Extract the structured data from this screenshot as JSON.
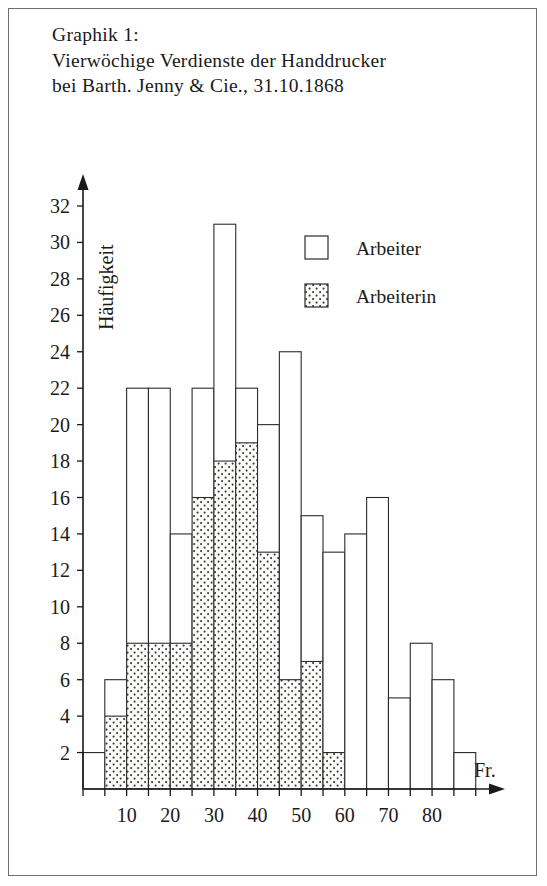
{
  "figure": {
    "title_lines": [
      "Graphik 1:",
      "Vierwöchige Verdienste der Handdrucker",
      "bei Barth. Jenny & Cie., 31.10.1868"
    ]
  },
  "axes": {
    "y_title": "Häufigkeit",
    "x_title": "Fr.",
    "y_ticklabels": [
      "2",
      "4",
      "6",
      "8",
      "10",
      "12",
      "14",
      "16",
      "18",
      "20",
      "22",
      "24",
      "26",
      "28",
      "30",
      "32"
    ],
    "x_ticklabels": [
      "10",
      "20",
      "30",
      "40",
      "50",
      "60",
      "70",
      "80"
    ]
  },
  "legend": {
    "position": "upper-right",
    "items": [
      {
        "label": "Arbeiter",
        "swatch": "white-box"
      },
      {
        "label": "Arbeiterin",
        "swatch": "dotted-box"
      }
    ]
  },
  "chart_data": {
    "type": "bar",
    "title": "Graphik 1: Vierwöchige Verdienste der Handdrucker bei Barth. Jenny & Cie., 31.10.1868",
    "xlabel": "Fr.",
    "ylabel": "Häufigkeit",
    "xlim": [
      0,
      92
    ],
    "ylim": [
      0,
      33
    ],
    "bin_width": 5,
    "grid": false,
    "stacked": true,
    "bin_starts": [
      0,
      5,
      10,
      15,
      20,
      25,
      30,
      35,
      40,
      45,
      50,
      55,
      60,
      65,
      70,
      75,
      80,
      85
    ],
    "bin_labels": [
      "0-5",
      "5-10",
      "10-15",
      "15-20",
      "20-25",
      "25-30",
      "30-35",
      "35-40",
      "40-45",
      "45-50",
      "50-55",
      "55-60",
      "60-65",
      "65-70",
      "70-75",
      "75-80",
      "80-85",
      "85-90"
    ],
    "series": [
      {
        "name": "Arbeiterin",
        "values": [
          0,
          4,
          8,
          8,
          8,
          16,
          18,
          19,
          13,
          6,
          7,
          2,
          0,
          0,
          0,
          0,
          0,
          0
        ]
      },
      {
        "name": "Arbeiter",
        "values": [
          2,
          2,
          14,
          14,
          6,
          6,
          13,
          3,
          7,
          18,
          8,
          11,
          14,
          16,
          5,
          8,
          6,
          2
        ]
      }
    ],
    "totals": [
      2,
      6,
      22,
      22,
      14,
      22,
      31,
      22,
      20,
      24,
      15,
      13,
      14,
      16,
      5,
      8,
      6,
      2
    ]
  },
  "colors": {
    "axis": "#1a1a1a",
    "bar_outline": "#2b2b2b",
    "bar_fill_arbeiter": "#ffffff",
    "bar_fill_arbeiterin": "#f2f2f0",
    "frame": "#6e6e72",
    "background": "#ffffff"
  }
}
